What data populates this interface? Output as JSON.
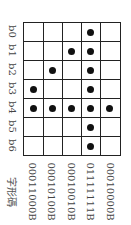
{
  "header": "字形碼",
  "bit_labels": [
    "b0",
    "b1",
    "b2",
    "b3",
    "b4",
    "b5",
    "b6"
  ],
  "codes": [
    "00011000B",
    "00010100B",
    "00010010B",
    "01111111B",
    "00010000B"
  ],
  "dots": [
    [
      3,
      4
    ],
    [
      2,
      4
    ],
    [
      1,
      4
    ],
    [
      0,
      1,
      2,
      3,
      4,
      5,
      6
    ],
    [
      4
    ]
  ]
}
